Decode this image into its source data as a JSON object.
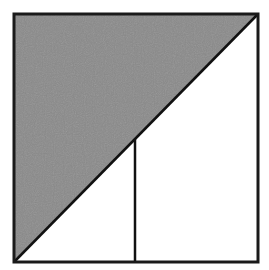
{
  "diagram": {
    "canvas": {
      "width": 269,
      "height": 270,
      "background": "#ffffff"
    },
    "square": {
      "x1": 14,
      "y1": 14,
      "x2": 258,
      "y2": 262,
      "stroke": "#1a1a1a",
      "stroke_width": 3
    },
    "shaded_triangle": {
      "points": "14,14 258,14 14,262",
      "fill": "#8a8a8a",
      "description": "upper-left triangle shaded gray"
    },
    "diagonal": {
      "x1": 14,
      "y1": 262,
      "x2": 258,
      "y2": 14,
      "stroke": "#111111",
      "stroke_width": 2.5
    },
    "vertical_segment": {
      "x1": 135,
      "y1": 139,
      "x2": 135,
      "y2": 262,
      "stroke": "#111111",
      "stroke_width": 2.5
    },
    "colors": {
      "shade": "#8a8a8a",
      "line": "#111111",
      "background": "#ffffff"
    }
  }
}
